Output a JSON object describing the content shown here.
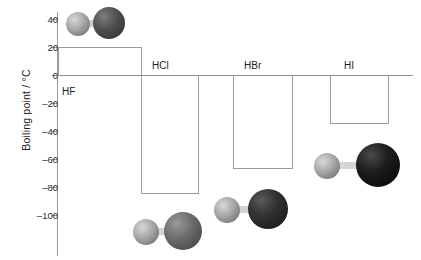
{
  "chart_data": {
    "type": "bar",
    "title": "",
    "xlabel": "",
    "ylabel": "Boiling point / °C",
    "categories": [
      "HF",
      "HCl",
      "HBr",
      "HI"
    ],
    "values": [
      20,
      -85,
      -67,
      -35
    ],
    "ylim": [
      -100,
      40
    ],
    "yticks": [
      40,
      20,
      0,
      -20,
      -40,
      -60,
      -80,
      -100
    ],
    "ytick_labels": [
      "40",
      "20",
      "0",
      "–20",
      "–40",
      "–60",
      "–80",
      "–100"
    ],
    "grid": false,
    "legend": "none",
    "annotations": [
      "HF molecule model above its bar",
      "HCl molecule model below its bar",
      "HBr molecule model below its bar",
      "HI molecule model below its bar"
    ]
  },
  "axis": {
    "y_title": "Boiling point / °C",
    "ticks": [
      {
        "label": "40",
        "value": 40
      },
      {
        "label": "20",
        "value": 20
      },
      {
        "label": "0",
        "value": 0
      },
      {
        "label": "–20",
        "value": -20
      },
      {
        "label": "–40",
        "value": -40
      },
      {
        "label": "–60",
        "value": -60
      },
      {
        "label": "–80",
        "value": -80
      },
      {
        "label": "–100",
        "value": -100
      }
    ]
  },
  "bars": [
    {
      "name": "HF",
      "label": "HF",
      "value": 20
    },
    {
      "name": "HCl",
      "label": "HCl",
      "value": -85
    },
    {
      "name": "HBr",
      "label": "HBr",
      "value": -67
    },
    {
      "name": "HI",
      "label": "HI",
      "value": -35
    }
  ],
  "molecules": [
    {
      "name": "hydrogen-fluoride",
      "atoms": [
        "H",
        "F"
      ],
      "halogen_color": "#4c4c4c"
    },
    {
      "name": "hydrogen-chloride",
      "atoms": [
        "H",
        "Cl"
      ],
      "halogen_color": "#6a6a6a"
    },
    {
      "name": "hydrogen-bromide",
      "atoms": [
        "H",
        "Br"
      ],
      "halogen_color": "#3a3a3a"
    },
    {
      "name": "hydrogen-iodide",
      "atoms": [
        "H",
        "I"
      ],
      "halogen_color": "#1d1d1d"
    }
  ],
  "colors": {
    "axis": "#8d8d8d",
    "bar_outline": "#9d9d9d",
    "text": "#1d1d1d",
    "hydrogen": "#a8a8a8",
    "background": "#ffffff"
  }
}
